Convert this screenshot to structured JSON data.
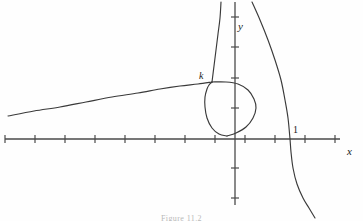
{
  "figure": {
    "title": "",
    "caption": "Figure 11.2",
    "background": "#fefefe",
    "stroke_color": "#3a3a3a",
    "axis_color": "#4a4a4a"
  },
  "labels": {
    "x_axis": "x",
    "y_axis": "y",
    "point_k": "k",
    "point_one": "1"
  },
  "chart_data": {
    "type": "line",
    "title": "",
    "xlabel": "x",
    "ylabel": "y",
    "grid": false,
    "legend": false,
    "axes": {
      "x_axis_pixel_y": 139,
      "y_axis_pixel_x": 235,
      "x_axis_span_px": [
        5,
        340
      ],
      "y_axis_span_px": [
        2,
        205
      ],
      "tick_spacing_px": 30,
      "x_ticks_px": [
        5,
        35,
        65,
        95,
        125,
        155,
        185,
        215,
        245,
        275,
        305,
        335
      ],
      "y_ticks_px": [
        17,
        47,
        78,
        108,
        168,
        198
      ],
      "origin_px": [
        235,
        139
      ],
      "labeled_x_ticks": [
        {
          "label": "1",
          "pixel_x": 290
        }
      ],
      "labeled_points": [
        {
          "label": "k",
          "pixel_x": 212,
          "pixel_y": 82
        }
      ]
    },
    "series": [
      {
        "name": "left-branch",
        "description": "Slowly rising branch entering from the left edge, climbing to the node point k",
        "points_px": [
          [
            8,
            116
          ],
          [
            34,
            111
          ],
          [
            60,
            107
          ],
          [
            86,
            102
          ],
          [
            112,
            97
          ],
          [
            138,
            93
          ],
          [
            160,
            89
          ],
          [
            180,
            86
          ],
          [
            198,
            84
          ],
          [
            212,
            82
          ]
        ]
      },
      {
        "name": "loop-upper",
        "description": "From node k the curve arcs right and down around the loop",
        "points_px": [
          [
            212,
            82
          ],
          [
            226,
            82
          ],
          [
            238,
            84
          ],
          [
            248,
            90
          ],
          [
            254,
            99
          ],
          [
            256,
            108
          ],
          [
            253,
            118
          ],
          [
            246,
            127
          ],
          [
            236,
            133
          ],
          [
            227,
            136
          ]
        ]
      },
      {
        "name": "loop-lower",
        "description": "Loop returns from the origin region leftwards and up back to node k",
        "points_px": [
          [
            227,
            136
          ],
          [
            219,
            134
          ],
          [
            212,
            128
          ],
          [
            207,
            118
          ],
          [
            205,
            107
          ],
          [
            205,
            97
          ],
          [
            207,
            89
          ],
          [
            209,
            85
          ],
          [
            212,
            82
          ]
        ]
      },
      {
        "name": "upper-vertical-branch",
        "description": "Nearly vertical branch rising from node k to the top edge of the frame",
        "points_px": [
          [
            212,
            82
          ],
          [
            214,
            66
          ],
          [
            216,
            50
          ],
          [
            218,
            34
          ],
          [
            220,
            18
          ],
          [
            221,
            2
          ]
        ]
      },
      {
        "name": "right-branch",
        "description": "Branch descending from upper right, bowing left, crossing the x-axis near 1, then curving back right and down",
        "points_px": [
          [
            252,
            2
          ],
          [
            260,
            20
          ],
          [
            268,
            40
          ],
          [
            275,
            60
          ],
          [
            281,
            80
          ],
          [
            285,
            100
          ],
          [
            288,
            118
          ],
          [
            290,
            139
          ],
          [
            291,
            152
          ],
          [
            293,
            168
          ],
          [
            297,
            184
          ],
          [
            303,
            198
          ],
          [
            309,
            208
          ],
          [
            315,
            218
          ]
        ]
      }
    ]
  }
}
